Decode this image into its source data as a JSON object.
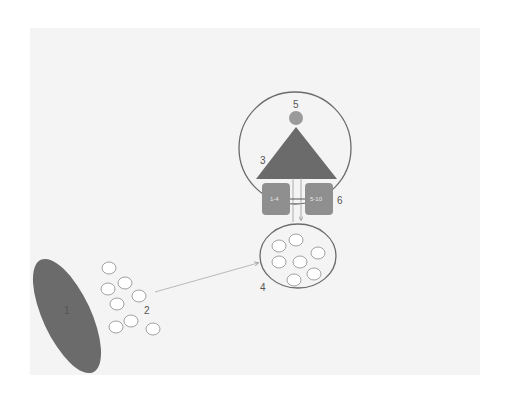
{
  "diagram": {
    "colors": {
      "background": "#ffffff",
      "panel": "#f4f4f4",
      "dark_shape": "#6b6b6b",
      "box_fill": "#8f8f8f",
      "small_circle_fill": "#9a9a9a",
      "outline": "#6b6b6b",
      "white_circle": "#ffffff",
      "arrow": "#aaaaaa"
    },
    "labels": {
      "l1": "1",
      "l2": "2",
      "l3": "3",
      "l4": "4",
      "l5": "5",
      "l6": "6"
    },
    "boxes": {
      "left": "1-4",
      "right": "5-10"
    }
  }
}
